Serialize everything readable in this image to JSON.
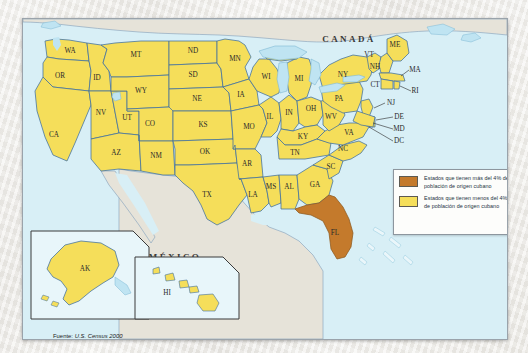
{
  "map": {
    "title": "Mapa de población de origen cubano en Estados Unidos",
    "countries": [
      {
        "name": "CANADÁ",
        "x": 326,
        "y": 23
      },
      {
        "name": "MÉXICO",
        "x": 152,
        "y": 241
      }
    ],
    "states": [
      {
        "code": "WA",
        "x": 47,
        "y": 32
      },
      {
        "code": "OR",
        "x": 37,
        "y": 58
      },
      {
        "code": "CA",
        "x": 29,
        "y": 117
      },
      {
        "code": "ID",
        "x": 74,
        "y": 60
      },
      {
        "code": "NV",
        "x": 51,
        "y": 92
      },
      {
        "code": "UT",
        "x": 82,
        "y": 101
      },
      {
        "code": "AZ",
        "x": 71,
        "y": 138
      },
      {
        "code": "MT",
        "x": 107,
        "y": 33
      },
      {
        "code": "WY",
        "x": 116,
        "y": 72
      },
      {
        "code": "CO",
        "x": 130,
        "y": 110
      },
      {
        "code": "NM",
        "x": 115,
        "y": 142
      },
      {
        "code": "ND",
        "x": 163,
        "y": 32
      },
      {
        "code": "SD",
        "x": 166,
        "y": 57
      },
      {
        "code": "NE",
        "x": 170,
        "y": 82
      },
      {
        "code": "KS",
        "x": 180,
        "y": 110
      },
      {
        "code": "OK",
        "x": 185,
        "y": 137
      },
      {
        "code": "TX",
        "x": 177,
        "y": 187
      },
      {
        "code": "MN",
        "x": 206,
        "y": 40
      },
      {
        "code": "IA",
        "x": 214,
        "y": 79
      },
      {
        "code": "MO",
        "x": 222,
        "y": 113
      },
      {
        "code": "AR",
        "x": 222,
        "y": 150
      },
      {
        "code": "LA",
        "x": 228,
        "y": 186
      },
      {
        "code": "WI",
        "x": 243,
        "y": 58
      },
      {
        "code": "IL",
        "x": 247,
        "y": 97
      },
      {
        "code": "MS",
        "x": 248,
        "y": 172
      },
      {
        "code": "MI",
        "x": 274,
        "y": 66
      },
      {
        "code": "IN",
        "x": 268,
        "y": 96
      },
      {
        "code": "AL",
        "x": 268,
        "y": 172
      },
      {
        "code": "OH",
        "x": 290,
        "y": 90
      },
      {
        "code": "KY",
        "x": 285,
        "y": 124
      },
      {
        "code": "TN",
        "x": 277,
        "y": 142
      },
      {
        "code": "GA",
        "x": 291,
        "y": 170
      },
      {
        "code": "SC",
        "x": 310,
        "y": 155
      },
      {
        "code": "NC",
        "x": 317,
        "y": 135
      },
      {
        "code": "VA",
        "x": 327,
        "y": 118
      },
      {
        "code": "WV",
        "x": 309,
        "y": 110
      },
      {
        "code": "PA",
        "x": 318,
        "y": 84
      },
      {
        "code": "NY",
        "x": 329,
        "y": 57
      },
      {
        "code": "VT",
        "x": 349,
        "y": 40
      },
      {
        "code": "NH",
        "x": 356,
        "y": 49
      },
      {
        "code": "ME",
        "x": 373,
        "y": 28
      },
      {
        "code": "MA",
        "x": 382,
        "y": 53
      },
      {
        "code": "CT",
        "x": 357,
        "y": 67
      },
      {
        "code": "RI",
        "x": 384,
        "y": 69
      },
      {
        "code": "NJ",
        "x": 361,
        "y": 88
      },
      {
        "code": "DE",
        "x": 366,
        "y": 104
      },
      {
        "code": "MD",
        "x": 367,
        "y": 115
      },
      {
        "code": "DC",
        "x": 365,
        "y": 127
      },
      {
        "code": "FL",
        "x": 311,
        "y": 212
      },
      {
        "code": "AK",
        "x": 63,
        "y": 254
      },
      {
        "code": "HI",
        "x": 143,
        "y": 272
      }
    ],
    "highlighted_states": [
      "FL"
    ]
  },
  "legend": {
    "items": [
      {
        "swatch_color": "#c47a2c",
        "text": "Estados que tienen más del 4% de población de origen cubano"
      },
      {
        "swatch_color": "#f5de5a",
        "text": "Estados que tienen menos del 4% de población de origen cubano"
      }
    ]
  },
  "source": {
    "label": "Fuente:",
    "value": "U.S. Census 2000"
  },
  "colors": {
    "ocean": "#d8eff6",
    "land_low": "#f5de5a",
    "land_high": "#c47a2c",
    "neighbor_land": "#e3e0d6",
    "border": "#3f6f9f",
    "lake": "#bfe4f2"
  }
}
